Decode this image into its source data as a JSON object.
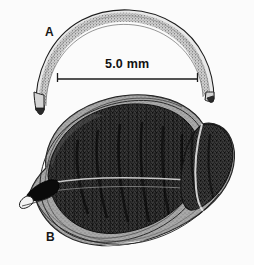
{
  "figure": {
    "type": "scientific-line-drawing",
    "background_color": "#fbfbfb",
    "ink_color": "#1a1a1a",
    "width": 254,
    "height": 265
  },
  "panels": [
    {
      "id": "A",
      "label": "A",
      "name": "specimen-a-crescent",
      "description": "slender arched sickle-shaped element with stippled surface",
      "label_x": 45,
      "label_y": 26
    },
    {
      "id": "B",
      "label": "B",
      "name": "specimen-b-valve",
      "description": "ovate valve with dark stippled interior and pointed anterior beak",
      "label_x": 46,
      "label_y": 231
    }
  ],
  "scale_bar": {
    "name": "scale-bar",
    "label": "5.0 mm",
    "value": 5.0,
    "unit": "mm",
    "x_start": 57,
    "x_end": 198,
    "y": 79,
    "tick_height": 9,
    "color": "#1a1a1a"
  }
}
